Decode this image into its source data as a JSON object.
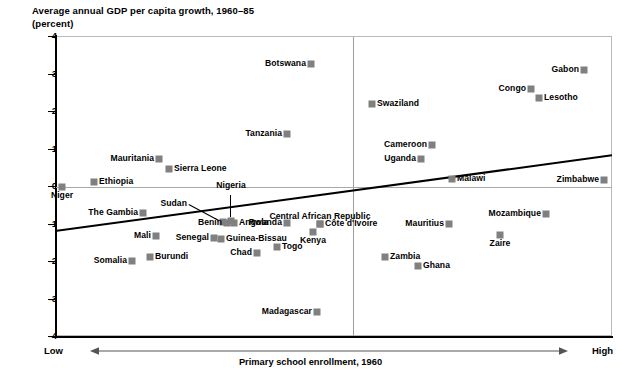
{
  "chart_data": {
    "type": "scatter",
    "title": "Average annual GDP per capita growth, 1960–85\n(percent)",
    "ylabel": "Average annual GDP per capita growth, 1960–85 (percent)",
    "xlabel": "Primary school enrollment, 1960",
    "xlim_low_label": "Low",
    "xlim_high_label": "High",
    "ylim": [
      -4,
      4
    ],
    "ytick_labels": [
      "4",
      "3",
      "2",
      "1",
      "0",
      "-1",
      "-2",
      "-3",
      "-4"
    ],
    "ytick_values": [
      4,
      3,
      2,
      1,
      0,
      -1,
      -2,
      -3,
      -4
    ],
    "grid": false,
    "legend": "none",
    "zero_reference_line": 0,
    "marker_color": "#808080",
    "trendline": {
      "description": "upward-sloping fitted regression line",
      "x_start_px": 55,
      "y_start_value": -1.2,
      "x_end_px": 612,
      "y_end_value": 0.82
    },
    "points": [
      {
        "name": "Botswana",
        "x_px": 311,
        "y": 3.25,
        "label_pos": "left"
      },
      {
        "name": "Gabon",
        "x_px": 584,
        "y": 3.1,
        "label_pos": "left"
      },
      {
        "name": "Congo",
        "x_px": 531,
        "y": 2.6,
        "label_pos": "left"
      },
      {
        "name": "Lesotho",
        "x_px": 539,
        "y": 2.35,
        "label_pos": "right"
      },
      {
        "name": "Swaziland",
        "x_px": 372,
        "y": 2.2,
        "label_pos": "right"
      },
      {
        "name": "Tanzania",
        "x_px": 287,
        "y": 1.4,
        "label_pos": "left"
      },
      {
        "name": "Cameroon",
        "x_px": 432,
        "y": 1.1,
        "label_pos": "left"
      },
      {
        "name": "Uganda",
        "x_px": 421,
        "y": 0.72,
        "label_pos": "left"
      },
      {
        "name": "Mauritania",
        "x_px": 159,
        "y": 0.72,
        "label_pos": "left"
      },
      {
        "name": "Sierra Leone",
        "x_px": 169,
        "y": 0.45,
        "label_pos": "right"
      },
      {
        "name": "Ethiopia",
        "x_px": 94,
        "y": 0.12,
        "label_pos": "right"
      },
      {
        "name": "Malawi",
        "x_px": 452,
        "y": 0.18,
        "label_pos": "right"
      },
      {
        "name": "Zimbabwe",
        "x_px": 604,
        "y": 0.17,
        "label_pos": "left"
      },
      {
        "name": "Niger",
        "x_px": 62,
        "y": -0.02,
        "label_pos": "below"
      },
      {
        "name": "The Gambia",
        "x_px": 143,
        "y": -0.73,
        "label_pos": "left"
      },
      {
        "name": "Nigeria",
        "x_px": 231,
        "y": -0.92,
        "label_pos": "leader-above"
      },
      {
        "name": "Sudan",
        "x_px": 223,
        "y": -0.95,
        "label_pos": "leader-left"
      },
      {
        "name": "Benin",
        "x_px": 227,
        "y": -0.98,
        "label_pos": "left"
      },
      {
        "name": "Angola",
        "x_px": 234,
        "y": -0.98,
        "label_pos": "right"
      },
      {
        "name": "Rwanda",
        "x_px": 287,
        "y": -0.98,
        "label_pos": "left"
      },
      {
        "name": "Central African Republic",
        "x_px": 320,
        "y": -1.0,
        "label_pos": "above"
      },
      {
        "name": "Côte d'Ivoire",
        "x_px": 320,
        "y": -1.0,
        "label_pos": "right"
      },
      {
        "name": "Mozambique",
        "x_px": 546,
        "y": -0.75,
        "label_pos": "left"
      },
      {
        "name": "Mauritius",
        "x_px": 449,
        "y": -1.02,
        "label_pos": "left"
      },
      {
        "name": "Kenya",
        "x_px": 313,
        "y": -1.22,
        "label_pos": "below"
      },
      {
        "name": "Zaire",
        "x_px": 500,
        "y": -1.3,
        "label_pos": "below"
      },
      {
        "name": "Mali",
        "x_px": 156,
        "y": -1.32,
        "label_pos": "left"
      },
      {
        "name": "Senegal",
        "x_px": 214,
        "y": -1.38,
        "label_pos": "left"
      },
      {
        "name": "Guinea-Bissau",
        "x_px": 221,
        "y": -1.42,
        "label_pos": "right"
      },
      {
        "name": "Togo",
        "x_px": 277,
        "y": -1.62,
        "label_pos": "right"
      },
      {
        "name": "Chad",
        "x_px": 257,
        "y": -1.78,
        "label_pos": "left"
      },
      {
        "name": "Burundi",
        "x_px": 150,
        "y": -1.88,
        "label_pos": "right"
      },
      {
        "name": "Zambia",
        "x_px": 385,
        "y": -1.88,
        "label_pos": "right"
      },
      {
        "name": "Somalia",
        "x_px": 132,
        "y": -2.0,
        "label_pos": "left"
      },
      {
        "name": "Ghana",
        "x_px": 418,
        "y": -2.12,
        "label_pos": "right"
      },
      {
        "name": "Madagascar",
        "x_px": 317,
        "y": -3.35,
        "label_pos": "left"
      }
    ]
  }
}
